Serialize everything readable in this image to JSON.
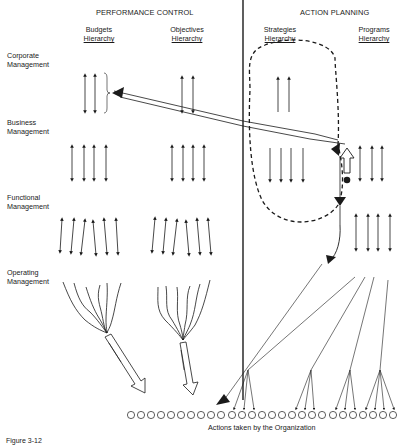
{
  "sections": {
    "left": "PERFORMANCE CONTROL",
    "right": "ACTION PLANNING"
  },
  "columns": [
    {
      "line1": "Budgets",
      "line2": "Hierarchy"
    },
    {
      "line1": "Objectives",
      "line2": "Hierarchy"
    },
    {
      "line1": "Strategies",
      "line2": "Hierarchy"
    },
    {
      "line1": "Programs",
      "line2": "Hierarchy"
    }
  ],
  "levels": [
    {
      "line1": "Corporate",
      "line2": "Management"
    },
    {
      "line1": "Business",
      "line2": "Management"
    },
    {
      "line1": "Functional",
      "line2": "Management"
    },
    {
      "line1": "Operating",
      "line2": "Management"
    }
  ],
  "footer": {
    "actions_label": "Actions taken by the Organization",
    "figure_caption": "Figure 3-12"
  },
  "diagram": {
    "action_circle_count": 28,
    "colors": {
      "line": "#1a1a1a",
      "background": "#ffffff"
    }
  }
}
